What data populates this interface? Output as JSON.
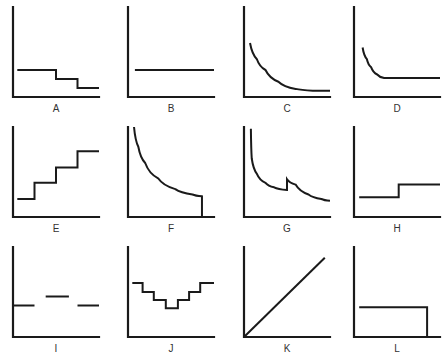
{
  "figure": {
    "ink_color": "#1a1a1a",
    "background": "#ffffff"
  },
  "chart_data": {
    "type": "line",
    "grid": false,
    "panels": [
      {
        "label": "A",
        "shape": "decreasing-step",
        "points": [
          [
            0.05,
            0.3
          ],
          [
            0.5,
            0.3
          ],
          [
            0.5,
            0.2
          ],
          [
            0.75,
            0.2
          ],
          [
            0.75,
            0.1
          ],
          [
            1.0,
            0.1
          ]
        ]
      },
      {
        "label": "B",
        "shape": "horizontal-constant",
        "points": [
          [
            0.08,
            0.3
          ],
          [
            1.0,
            0.3
          ]
        ]
      },
      {
        "label": "C",
        "shape": "decreasing-curve-asymptotic",
        "points": [
          [
            0.07,
            0.6
          ],
          [
            0.15,
            0.42
          ],
          [
            0.25,
            0.3
          ],
          [
            0.4,
            0.17
          ],
          [
            0.6,
            0.09
          ],
          [
            0.8,
            0.07
          ],
          [
            1.0,
            0.07
          ]
        ]
      },
      {
        "label": "D",
        "shape": "decreasing-curve-then-flat",
        "points": [
          [
            0.1,
            0.55
          ],
          [
            0.15,
            0.42
          ],
          [
            0.2,
            0.33
          ],
          [
            0.27,
            0.25
          ],
          [
            0.35,
            0.21
          ],
          [
            1.0,
            0.21
          ]
        ]
      },
      {
        "label": "E",
        "shape": "increasing-step",
        "points": [
          [
            0.05,
            0.2
          ],
          [
            0.25,
            0.2
          ],
          [
            0.25,
            0.38
          ],
          [
            0.5,
            0.38
          ],
          [
            0.5,
            0.55
          ],
          [
            0.75,
            0.55
          ],
          [
            0.75,
            0.73
          ],
          [
            1.0,
            0.73
          ]
        ]
      },
      {
        "label": "F",
        "shape": "decreasing-curve-with-drop",
        "points": [
          [
            0.07,
            1.0
          ],
          [
            0.12,
            0.78
          ],
          [
            0.2,
            0.6
          ],
          [
            0.35,
            0.43
          ],
          [
            0.55,
            0.31
          ],
          [
            0.75,
            0.25
          ],
          [
            0.86,
            0.23
          ],
          [
            0.86,
            0.0
          ]
        ]
      },
      {
        "label": "G",
        "shape": "decreasing-curve-with-jump",
        "points": [
          [
            0.08,
            0.98
          ],
          [
            0.09,
            0.65
          ],
          [
            0.15,
            0.48
          ],
          [
            0.25,
            0.38
          ],
          [
            0.35,
            0.33
          ],
          [
            0.5,
            0.3
          ],
          [
            0.5,
            0.42
          ],
          [
            0.6,
            0.36
          ],
          [
            0.75,
            0.25
          ],
          [
            0.9,
            0.2
          ],
          [
            1.0,
            0.18
          ]
        ]
      },
      {
        "label": "H",
        "shape": "single-step-up",
        "points": [
          [
            0.06,
            0.22
          ],
          [
            0.52,
            0.22
          ],
          [
            0.52,
            0.36
          ],
          [
            1.0,
            0.36
          ]
        ]
      },
      {
        "label": "I",
        "shape": "discontinuous-segments",
        "segments": [
          [
            [
              0.0,
              0.35
            ],
            [
              0.25,
              0.35
            ]
          ],
          [
            [
              0.38,
              0.45
            ],
            [
              0.65,
              0.45
            ]
          ],
          [
            [
              0.75,
              0.35
            ],
            [
              1.0,
              0.35
            ]
          ]
        ]
      },
      {
        "label": "J",
        "shape": "u-shaped-step",
        "points": [
          [
            0.05,
            0.6
          ],
          [
            0.17,
            0.6
          ],
          [
            0.17,
            0.5
          ],
          [
            0.3,
            0.5
          ],
          [
            0.3,
            0.41
          ],
          [
            0.44,
            0.41
          ],
          [
            0.44,
            0.32
          ],
          [
            0.58,
            0.32
          ],
          [
            0.58,
            0.41
          ],
          [
            0.71,
            0.41
          ],
          [
            0.71,
            0.5
          ],
          [
            0.84,
            0.5
          ],
          [
            0.84,
            0.6
          ],
          [
            1.0,
            0.6
          ]
        ]
      },
      {
        "label": "K",
        "shape": "linear-from-origin",
        "points": [
          [
            0.0,
            0.0
          ],
          [
            0.94,
            0.88
          ]
        ]
      },
      {
        "label": "L",
        "shape": "flat-then-drop",
        "points": [
          [
            0.06,
            0.33
          ],
          [
            0.85,
            0.33
          ],
          [
            0.85,
            0.0
          ]
        ]
      }
    ]
  }
}
